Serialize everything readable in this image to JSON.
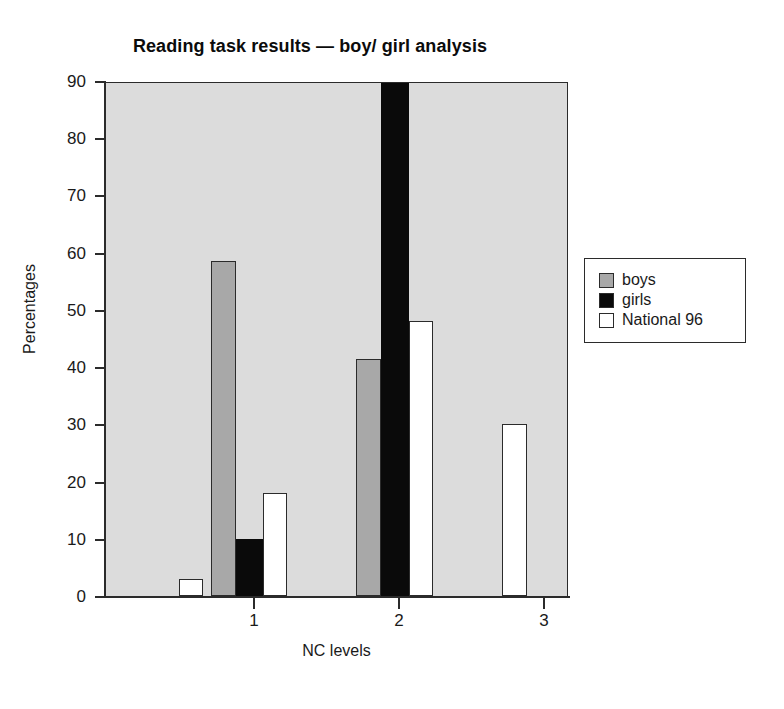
{
  "chart_data": {
    "type": "bar",
    "title": "Reading task results — boy/ girl analysis",
    "xlabel": "NC levels",
    "ylabel": "Percentages",
    "ylim": [
      0,
      90
    ],
    "ytick_labels": [
      "0",
      "10",
      "20",
      "30",
      "40",
      "50",
      "60",
      "70",
      "80",
      "90"
    ],
    "yticks": [
      0,
      10,
      20,
      30,
      40,
      50,
      60,
      70,
      80,
      90
    ],
    "grid": false,
    "legend_position": "right",
    "categories": [
      "W",
      "1",
      "2",
      "3"
    ],
    "xtick_labels": [
      "1",
      "2",
      "3"
    ],
    "series": [
      {
        "name": "boys",
        "color": "#a8a8a8",
        "values": [
          0,
          58.5,
          41.5,
          0
        ]
      },
      {
        "name": "girls",
        "color": "#0a0a0a",
        "values": [
          0,
          10,
          90,
          0
        ],
        "clipped": [
          false,
          false,
          true,
          false
        ]
      },
      {
        "name": "National 96",
        "color": "#ffffff",
        "values": [
          3,
          18,
          48,
          30
        ]
      }
    ],
    "bars": [
      {
        "group": "W",
        "series": "National 96",
        "value": 3,
        "x": 73,
        "width": 24,
        "color": "#ffffff"
      },
      {
        "group": "1",
        "series": "boys",
        "value": 58.5,
        "x": 105,
        "width": 25,
        "color": "#a8a8a8"
      },
      {
        "group": "1",
        "series": "girls",
        "value": 10,
        "x": 130,
        "width": 27,
        "color": "#0a0a0a"
      },
      {
        "group": "1",
        "series": "National 96",
        "value": 18,
        "x": 157,
        "width": 24,
        "color": "#ffffff"
      },
      {
        "group": "2",
        "series": "boys",
        "value": 41.5,
        "x": 250,
        "width": 25,
        "color": "#a8a8a8"
      },
      {
        "group": "2",
        "series": "girls",
        "value": 90,
        "x": 275,
        "width": 28,
        "color": "#0a0a0a"
      },
      {
        "group": "2",
        "series": "National 96",
        "value": 48,
        "x": 303,
        "width": 24,
        "color": "#ffffff"
      },
      {
        "group": "3",
        "series": "National 96",
        "value": 30,
        "x": 396,
        "width": 25,
        "color": "#ffffff"
      }
    ],
    "xtick_positions": [
      148,
      293,
      438
    ]
  },
  "legend": {
    "items": [
      {
        "label": "boys"
      },
      {
        "label": "girls"
      },
      {
        "label": "National 96"
      }
    ]
  }
}
